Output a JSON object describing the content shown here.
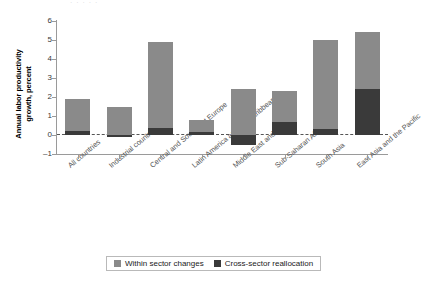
{
  "header_fragment": "· ·   ·   ·    ·",
  "legend": {
    "items": [
      {
        "label": "Within sector changes",
        "color": "#8a8a8a",
        "key": "within"
      },
      {
        "label": "Cross-sector reallocation",
        "color": "#3a3a3a",
        "key": "cross"
      }
    ]
  },
  "chart_data": {
    "type": "bar",
    "title": "",
    "subtitle": "",
    "xlabel": "",
    "ylabel": "Annual labor productivity growth, percent",
    "ylim": [
      -1,
      6
    ],
    "yticks": [
      6,
      5,
      4,
      3,
      2,
      1,
      0,
      -1
    ],
    "ytick_labels": [
      "6",
      "5",
      "4",
      "3",
      "2",
      "1",
      "0",
      "–1"
    ],
    "grid": false,
    "zero_reference_line": true,
    "stacked": true,
    "legend_position": "bottom",
    "categories": [
      "All countries",
      "Industrial countries",
      "Central and Southeast Europe",
      "Latin America and the Caribbean",
      "Middle East and Africa",
      "Sub-Saharan Africa",
      "South Asia",
      "East Asia and the Pacific"
    ],
    "series": [
      {
        "name": "Cross-sector reallocation",
        "key": "cross",
        "color": "#3a3a3a",
        "values": [
          0.2,
          -0.1,
          0.35,
          0.15,
          -0.5,
          0.7,
          0.3,
          2.4
        ]
      },
      {
        "name": "Within sector changes",
        "key": "within",
        "color": "#8a8a8a",
        "values": [
          1.7,
          1.5,
          4.55,
          0.65,
          2.4,
          1.6,
          4.7,
          3.0
        ]
      }
    ],
    "totals": [
      1.9,
      1.4,
      4.9,
      0.8,
      1.9,
      2.3,
      5.0,
      5.4
    ]
  }
}
